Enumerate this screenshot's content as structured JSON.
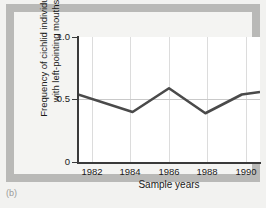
{
  "figure": {
    "caption": "(b)",
    "panel_background": "#b9b9b7",
    "plot_background": "#ffffff",
    "line_color": "#4a4a4a",
    "grid_color": "#dcdcdc"
  },
  "chart_data": {
    "type": "line",
    "title": "",
    "xlabel": "Sample years",
    "ylabel": "Frequency of cichlid individuals with left-pointing mouths",
    "ylabel_line1": "Frequency of cichlid individuals",
    "ylabel_line2": "with left-pointing mouths",
    "xlim": [
      1981,
      1991
    ],
    "ylim": [
      0,
      1.0
    ],
    "ytick_labels": [
      "1.0",
      "0.5",
      "0"
    ],
    "ytick_values": [
      1.0,
      0.5,
      0
    ],
    "xtick_labels": [
      "1982",
      "1984",
      "1986",
      "1988",
      "1990"
    ],
    "xtick_values": [
      1982,
      1984,
      1986,
      1988,
      1990
    ],
    "grid": "vertical gridlines at x ticks; horizontal reference line at y = 0.5",
    "reference_line_y": 0.5,
    "legend": "none",
    "x": [
      1981,
      1984,
      1986,
      1988,
      1990,
      1991
    ],
    "values": [
      0.54,
      0.4,
      0.59,
      0.39,
      0.54,
      0.56
    ],
    "series": [
      {
        "name": "Frequency of left-pointing mouths",
        "x": [
          1981,
          1984,
          1986,
          1988,
          1990,
          1991
        ],
        "values": [
          0.54,
          0.4,
          0.59,
          0.39,
          0.54,
          0.56
        ]
      }
    ]
  }
}
